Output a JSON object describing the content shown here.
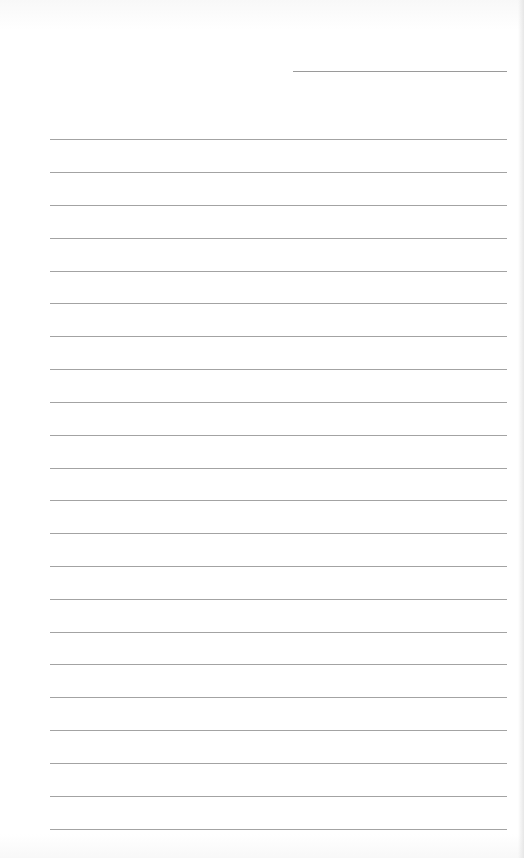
{
  "page": {
    "type": "lined-paper",
    "background_color": "#ffffff",
    "line_color": "#a3a3a3"
  },
  "header_line": {
    "x_start": 293,
    "x_end": 507,
    "y": 71
  },
  "ruled_lines": {
    "count": 22,
    "x_start": 50,
    "x_end": 507,
    "y_positions": [
      139,
      172,
      205,
      238,
      271,
      303,
      336,
      369,
      402,
      435,
      468,
      500,
      533,
      566,
      599,
      632,
      664,
      697,
      730,
      763,
      796,
      829
    ]
  }
}
